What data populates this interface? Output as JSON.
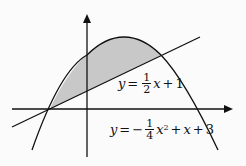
{
  "diagram": {
    "type": "function-graph",
    "axes": {
      "x_arrow": true,
      "y_arrow": true
    },
    "curves": [
      {
        "id": "line",
        "equation": "y = 1/2 x + 1",
        "label": {
          "lhs": "y",
          "eq": "=",
          "num": "1",
          "den": "2",
          "var": "x",
          "op": "+",
          "const": "1"
        }
      },
      {
        "id": "parabola",
        "equation": "y = -1/4 x^2 + x + 3",
        "label": {
          "lhs": "y",
          "eq": "=",
          "sign": "−",
          "num": "1",
          "den": "4",
          "var": "x",
          "exp": "2",
          "op1": "+",
          "var2": "x",
          "op2": "+",
          "const": "3"
        }
      }
    ],
    "shaded_region": {
      "between": [
        "line",
        "parabola"
      ],
      "x_from": -2,
      "x_to": 4,
      "color": "#c8c8c8"
    },
    "intersection_points": [
      [
        -2,
        0
      ],
      [
        4,
        3
      ]
    ],
    "colors": {
      "stroke": "#111111",
      "fill": "#c8c8c8",
      "background": "#fbfbfb"
    }
  }
}
